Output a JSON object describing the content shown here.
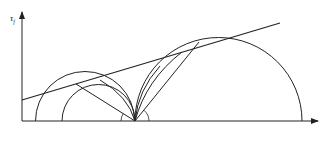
{
  "diagram": {
    "type": "Mohr-Coulomb stress circles (Rankine earth pressure states)",
    "axes": {
      "y_label": "τf",
      "x_label": "σ",
      "origin_label": "O"
    },
    "strength_line": {
      "label": "τf=c+σ tan φ"
    },
    "circles": [
      {
        "id": "circle-1",
        "label": "①",
        "left_point_label": "K0γz",
        "right_point_label": "γz"
      },
      {
        "id": "circle-2",
        "label": "②"
      },
      {
        "id": "circle-3",
        "label": "③"
      }
    ],
    "angles": [
      {
        "label": "45°−φ/2"
      },
      {
        "label": "45°+φ/2"
      }
    ],
    "points": {
      "k0_label": "K0γz",
      "k0_main": "K",
      "k0_sub": "0",
      "k0_rest": "γz",
      "gamma_z": "γz"
    },
    "colors": {
      "stroke": "#222222",
      "background": "#ffffff"
    }
  }
}
